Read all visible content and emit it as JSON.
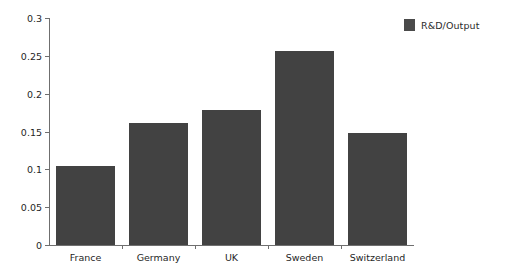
{
  "chart_data": {
    "type": "bar",
    "title": "",
    "subtitle": "",
    "xlabel": "",
    "ylabel": "",
    "categories": [
      "France",
      "Germany",
      "UK",
      "Sweden",
      "Switzerland"
    ],
    "series": [
      {
        "name": "R&D/Output",
        "color": "#424242",
        "values": [
          0.105,
          0.161,
          0.178,
          0.256,
          0.148
        ]
      }
    ],
    "ylim": [
      0,
      0.3
    ],
    "ytick_values": [
      0,
      0.05,
      0.1,
      0.15,
      0.2,
      0.25,
      0.3
    ],
    "ytick_labels": [
      "0",
      "0.05",
      "0.1",
      "0.15",
      "0.2",
      "0.25",
      "0.3"
    ],
    "grid": false,
    "legend_position": "top-right",
    "legend_entries": [
      {
        "label": "R&D/Output",
        "color": "#424242"
      }
    ]
  },
  "colors": {
    "bar": "#424242",
    "legend_swatch": "#4a4a4a",
    "axis": "#6f6f6f",
    "text": "#1f1f1f",
    "background": "#ffffff"
  }
}
